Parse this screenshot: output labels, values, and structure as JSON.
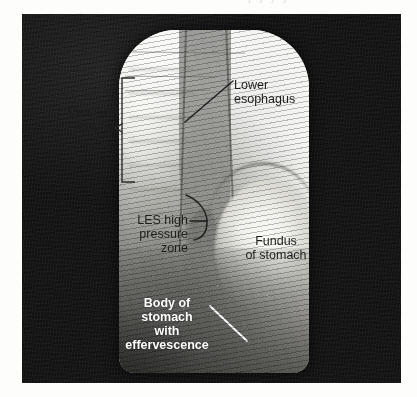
{
  "figure": {
    "type": "fluoroscopic-barium-swallow-radiograph",
    "artifact_text": "j j j j",
    "annotations": [
      {
        "id": "vertebral-column",
        "label": "Vertebral\ncolumn",
        "style": "dark",
        "marker": "bracket",
        "color": "#1d1d1d"
      },
      {
        "id": "lower-esophagus",
        "label": "Lower\nesophagus",
        "style": "dark",
        "marker": "leader-line",
        "color": "#1d1d1d"
      },
      {
        "id": "les-high-pressure-zone",
        "label": "LES high\npressure\nzone",
        "style": "dark",
        "marker": "curved-bracket",
        "color": "#1d1d1d"
      },
      {
        "id": "fundus-of-stomach",
        "label": "Fundus\nof stomach",
        "style": "dark",
        "marker": "none",
        "color": "#1d1d1d"
      },
      {
        "id": "body-of-stomach-with-effervescence",
        "label": "Body of\nstomach\nwith\neffervescence",
        "style": "white-bold",
        "marker": "leader-line",
        "color": "#ffffff"
      }
    ]
  },
  "colors": {
    "panel_background": "#141414",
    "page_background": "#fdfdfc",
    "fluoro_bright": "#fbfbf7",
    "fluoro_mid": "#b9b9b4",
    "annotation_dark": "#1d1d1d",
    "annotation_light": "#ffffff"
  }
}
